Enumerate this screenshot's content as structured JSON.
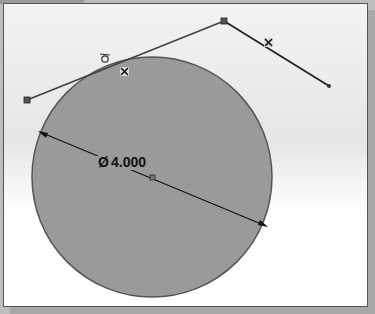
{
  "sketch": {
    "dimension": {
      "symbol": "Ø",
      "value": "4.000"
    },
    "colors": {
      "circle_fill": "#9a9a9a",
      "circle_stroke": "#555555",
      "line": "#333333",
      "background": "#f3f3f3"
    },
    "circle": {
      "cx": 152,
      "cy": 177,
      "r": 120
    },
    "polyline": [
      [
        27,
        100
      ],
      [
        224,
        21
      ],
      [
        329,
        86
      ]
    ],
    "constraint_icons": [
      "tangent-constraint-icon",
      "coincident-constraint-icon",
      "coincident-constraint-icon"
    ]
  }
}
